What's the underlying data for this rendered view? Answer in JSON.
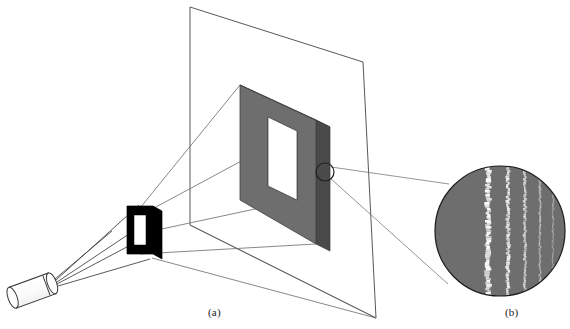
{
  "figure": {
    "width": 570,
    "height": 329,
    "background_color": "#ffffff"
  },
  "captions": {
    "panel_a": "(a)",
    "panel_b": "(b)"
  },
  "colors": {
    "line": "#58585a",
    "line_dark": "#2b2b2d",
    "aperture_black": "#000000",
    "screen_gray_front": "#6e6e6e",
    "screen_gray_side": "#4a4a4a",
    "fringe_gray": "#6e6e6e",
    "fringe_bright": "#ffffff",
    "white": "#ffffff",
    "caption_text": "#1a1a1a"
  },
  "elements": {
    "laser": {
      "name": "laser source",
      "body_angle_deg": -18,
      "tip_x": 53,
      "tip_y": 282,
      "length": 46,
      "radius": 11,
      "ray_count": 5
    },
    "aperture": {
      "name": "rectangular aperture plate",
      "front_tl_x": 127,
      "front_tl_y": 206,
      "front_width": 26,
      "front_height": 48,
      "slot_inset_x": 7,
      "slot_inset_y": 9,
      "depth_dx": 9,
      "depth_dy": 5
    },
    "screen_plane": {
      "name": "observation plane outline",
      "tl_x": 190,
      "tl_y": 7,
      "tr_x": 363,
      "tr_y": 62,
      "br_x": 376,
      "br_y": 318,
      "bl_x": 190,
      "bl_y": 225
    },
    "projection_slab": {
      "name": "projected bright rectangle on screen",
      "tl_x": 240,
      "tl_y": 85,
      "tr_x": 316,
      "tr_y": 120,
      "br_x": 316,
      "br_y": 244,
      "bl_x": 240,
      "bl_y": 200,
      "window_tl_x": 268,
      "window_tl_y": 117,
      "window_tr_x": 297,
      "window_tr_y": 131,
      "window_br_x": 297,
      "window_br_y": 200,
      "window_bl_x": 268,
      "window_bl_y": 186,
      "side_depth": 14
    },
    "callout_circle": {
      "name": "region of interest marker",
      "cx": 325,
      "cy": 172,
      "r": 9
    },
    "magnifier": {
      "name": "magnified fringe view",
      "cx": 500,
      "cy": 231,
      "r": 65
    }
  },
  "chart_data": {
    "type": "image",
    "axis": "horizontal position across the aperture edge",
    "fringes": [
      {
        "index": 1,
        "offset_x": -12,
        "width": 5.0,
        "intensity": 1.0,
        "roughness": 2.4
      },
      {
        "index": 2,
        "offset_x": 8,
        "width": 3.2,
        "intensity": 0.86,
        "roughness": 2.0
      },
      {
        "index": 3,
        "offset_x": 25,
        "width": 2.4,
        "intensity": 0.7,
        "roughness": 1.8
      },
      {
        "index": 4,
        "offset_x": 40,
        "width": 1.8,
        "intensity": 0.54,
        "roughness": 1.5
      },
      {
        "index": 5,
        "offset_x": 53,
        "width": 1.4,
        "intensity": 0.4,
        "roughness": 1.3
      }
    ],
    "shadow_region": {
      "from_x": -65,
      "to_x": -14,
      "intensity": 0.0
    },
    "background_level": 0.0,
    "legend": []
  }
}
